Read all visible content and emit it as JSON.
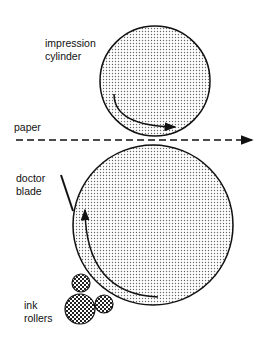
{
  "labels": {
    "impression": [
      "impression",
      "cylinder"
    ],
    "paper": "paper",
    "doctor": [
      "doctor",
      "blade"
    ],
    "ink": [
      "ink",
      "rollers"
    ]
  },
  "colors": {
    "stroke": "#111111",
    "dot": "#555555",
    "ink_dot": "#222222"
  }
}
